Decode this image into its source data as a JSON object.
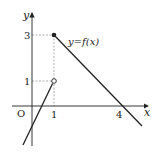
{
  "figure": {
    "type": "function-graph",
    "curve_label": "y=f(x)",
    "axes": {
      "x_label": "x",
      "y_label": "y",
      "origin_label": "O"
    },
    "x_ticks": [
      {
        "value": 1,
        "label": "1"
      },
      {
        "value": 4,
        "label": "4"
      }
    ],
    "y_ticks": [
      {
        "value": 1,
        "label": "1"
      },
      {
        "value": 3,
        "label": "3"
      }
    ],
    "points": [
      {
        "x": 1,
        "y": 3,
        "style": "filled"
      },
      {
        "x": 1,
        "y": 1,
        "style": "open"
      }
    ],
    "segments": [
      {
        "description": "line through (1,1) open end, increasing, crossing x-axis between 0 and 1",
        "from": [
          -0.35,
          -1.6
        ],
        "to": [
          1,
          1
        ]
      },
      {
        "description": "line from (1,3) closed end, decreasing, crossing x-axis at 4",
        "from": [
          1,
          3
        ],
        "to": [
          4.9,
          -0.85
        ]
      }
    ],
    "colors": {
      "line": "#222222",
      "guide": "#999999"
    }
  }
}
